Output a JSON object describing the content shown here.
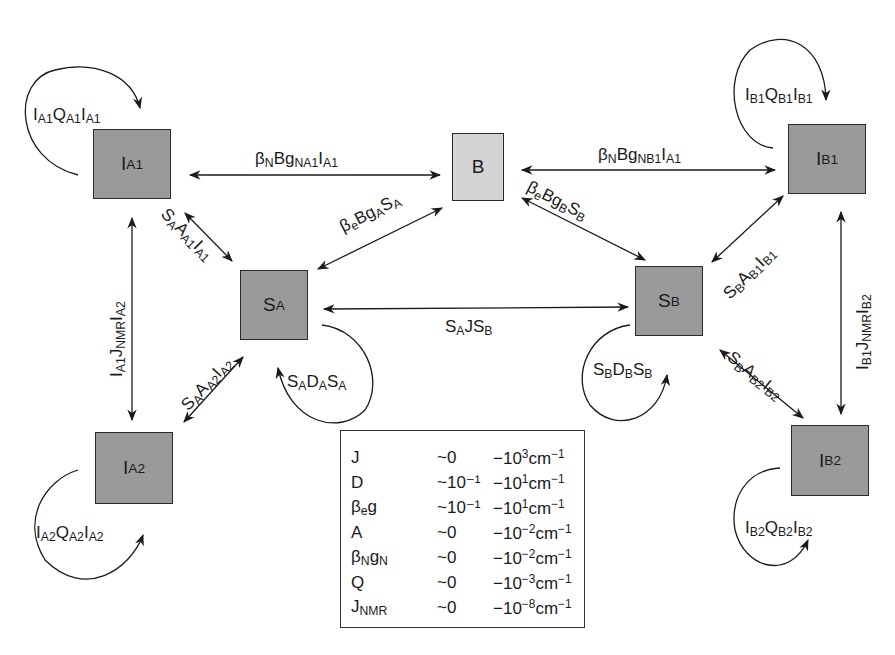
{
  "nodes": {
    "IA1": {
      "main": "I",
      "sub": "A1"
    },
    "IA2": {
      "main": "I",
      "sub": "A2"
    },
    "SA": {
      "main": "S",
      "sub": "A"
    },
    "B": {
      "main": "B",
      "sub": ""
    },
    "SB": {
      "main": "S",
      "sub": "B"
    },
    "IB1": {
      "main": "I",
      "sub": "B1"
    },
    "IB2": {
      "main": "I",
      "sub": "B2"
    }
  },
  "edges": {
    "IA1_B": [
      {
        "t": "β"
      },
      {
        "s": "N"
      },
      {
        "t": "Bg"
      },
      {
        "s": "NA1"
      },
      {
        "t": "I"
      },
      {
        "s": "A1"
      }
    ],
    "B_IB1": [
      {
        "t": "β"
      },
      {
        "s": "N"
      },
      {
        "t": "Bg"
      },
      {
        "s": "NB1"
      },
      {
        "t": "I"
      },
      {
        "s": "A1"
      }
    ],
    "SA_B": [
      {
        "t": "β"
      },
      {
        "s": "e"
      },
      {
        "t": "Bg"
      },
      {
        "s": "A"
      },
      {
        "t": "S"
      },
      {
        "s": "A"
      }
    ],
    "B_SB": [
      {
        "t": "β"
      },
      {
        "s": "e"
      },
      {
        "t": "Bg"
      },
      {
        "s": "B"
      },
      {
        "t": "S"
      },
      {
        "s": "B"
      }
    ],
    "SA_SB": [
      {
        "t": "S"
      },
      {
        "s": "A"
      },
      {
        "t": "JS"
      },
      {
        "s": "B"
      }
    ],
    "IA1_SA": [
      {
        "t": "S"
      },
      {
        "s": "A"
      },
      {
        "t": "A"
      },
      {
        "s": "A1"
      },
      {
        "t": "I"
      },
      {
        "s": "A1"
      }
    ],
    "IA2_SA": [
      {
        "t": "S"
      },
      {
        "s": "A"
      },
      {
        "t": "A"
      },
      {
        "s": "A2"
      },
      {
        "t": "I"
      },
      {
        "s": "A2"
      }
    ],
    "IB1_SB": [
      {
        "t": "S"
      },
      {
        "s": "B"
      },
      {
        "t": "A"
      },
      {
        "s": "B1"
      },
      {
        "t": "I"
      },
      {
        "s": "B1"
      }
    ],
    "IB2_SB": [
      {
        "t": "S"
      },
      {
        "s": "B"
      },
      {
        "t": "A"
      },
      {
        "s": "B2"
      },
      {
        "t": "I"
      },
      {
        "s": "B2"
      }
    ],
    "IA1_IA2": [
      {
        "t": "I"
      },
      {
        "s": "A1"
      },
      {
        "t": "J"
      },
      {
        "s": "NMR"
      },
      {
        "t": "I"
      },
      {
        "s": "A2"
      }
    ],
    "IB1_IB2": [
      {
        "t": "I"
      },
      {
        "s": "B1"
      },
      {
        "t": "J"
      },
      {
        "s": "NMR"
      },
      {
        "t": "I"
      },
      {
        "s": "B2"
      }
    ],
    "loop_IA1": [
      {
        "t": "I"
      },
      {
        "s": "A1"
      },
      {
        "t": "Q"
      },
      {
        "s": "A1"
      },
      {
        "t": "I"
      },
      {
        "s": "A1"
      }
    ],
    "loop_IA2": [
      {
        "t": "I"
      },
      {
        "s": "A2"
      },
      {
        "t": "Q"
      },
      {
        "s": "A2"
      },
      {
        "t": "I"
      },
      {
        "s": "A2"
      }
    ],
    "loop_IB1": [
      {
        "t": "I"
      },
      {
        "s": "B1"
      },
      {
        "t": "Q"
      },
      {
        "s": "B1"
      },
      {
        "t": "I"
      },
      {
        "s": "B1"
      }
    ],
    "loop_IB2": [
      {
        "t": "I"
      },
      {
        "s": "B2"
      },
      {
        "t": "Q"
      },
      {
        "s": "B2"
      },
      {
        "t": "I"
      },
      {
        "s": "B2"
      }
    ],
    "loop_SA": [
      {
        "t": "S"
      },
      {
        "s": "A"
      },
      {
        "t": "D"
      },
      {
        "s": "A"
      },
      {
        "t": "S"
      },
      {
        "s": "A"
      }
    ],
    "loop_SB": [
      {
        "t": "S"
      },
      {
        "s": "B"
      },
      {
        "t": "D"
      },
      {
        "s": "B"
      },
      {
        "t": "S"
      },
      {
        "s": "B"
      }
    ]
  },
  "legend": {
    "rows": [
      {
        "term": [
          {
            "t": "J"
          }
        ],
        "low": "~0",
        "high_base": "−10",
        "high_exp": "3",
        "unit_base": "cm",
        "unit_exp": "−1"
      },
      {
        "term": [
          {
            "t": "D"
          }
        ],
        "low": "~10⁻¹",
        "high_base": "−10",
        "high_exp": "1",
        "unit_base": "cm",
        "unit_exp": "−1"
      },
      {
        "term": [
          {
            "t": "β"
          },
          {
            "s": "e"
          },
          {
            "t": "g"
          }
        ],
        "low": "~10⁻¹",
        "high_base": "−10",
        "high_exp": "1",
        "unit_base": "cm",
        "unit_exp": "−1"
      },
      {
        "term": [
          {
            "t": "A"
          }
        ],
        "low": "~0",
        "high_base": "−10",
        "high_exp": "−2",
        "unit_base": "cm",
        "unit_exp": "−1"
      },
      {
        "term": [
          {
            "t": "β"
          },
          {
            "s": "N"
          },
          {
            "t": "g"
          },
          {
            "s": "N"
          }
        ],
        "low": "~0",
        "high_base": "−10",
        "high_exp": "−2",
        "unit_base": "cm",
        "unit_exp": "−1"
      },
      {
        "term": [
          {
            "t": "Q"
          }
        ],
        "low": "~0",
        "high_base": "−10",
        "high_exp": "−3",
        "unit_base": "cm",
        "unit_exp": "−1"
      },
      {
        "term": [
          {
            "t": "J"
          },
          {
            "s": "NMR"
          }
        ],
        "low": "~0",
        "high_base": "−10",
        "high_exp": "−8",
        "unit_base": "cm",
        "unit_exp": "−1"
      }
    ]
  }
}
